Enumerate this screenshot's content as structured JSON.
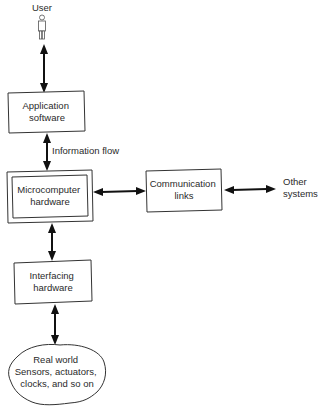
{
  "diagram": {
    "user": {
      "label": "User",
      "icon": "person-icon"
    },
    "nodes": {
      "application": {
        "lines": [
          "Application",
          "software"
        ]
      },
      "microcomputer": {
        "lines": [
          "Microcomputer",
          "hardware"
        ]
      },
      "communication": {
        "lines": [
          "Communication",
          "links"
        ]
      },
      "interfacing": {
        "lines": [
          "Interfacing",
          "hardware"
        ]
      },
      "real_world": {
        "lines": [
          "Real world",
          "Sensors, actuators,",
          "clocks, and so on"
        ]
      },
      "other_systems": {
        "lines": [
          "Other",
          "systems"
        ]
      }
    },
    "edge_labels": {
      "information_flow": "Information flow"
    },
    "edges": [
      {
        "from": "user",
        "to": "application",
        "type": "bidirectional"
      },
      {
        "from": "application",
        "to": "microcomputer",
        "type": "bidirectional",
        "label": "Information flow"
      },
      {
        "from": "microcomputer",
        "to": "communication",
        "type": "bidirectional"
      },
      {
        "from": "communication",
        "to": "other_systems",
        "type": "bidirectional"
      },
      {
        "from": "microcomputer",
        "to": "interfacing",
        "type": "bidirectional"
      },
      {
        "from": "interfacing",
        "to": "real_world",
        "type": "bidirectional"
      }
    ]
  }
}
